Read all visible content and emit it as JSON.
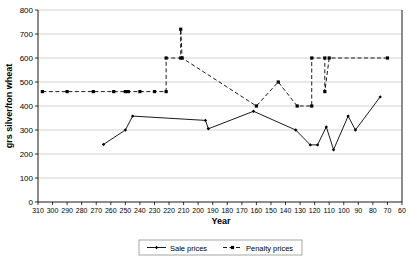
{
  "chart_data": {
    "type": "line",
    "title": "",
    "xlabel": "Year",
    "ylabel": "grs silver/ton wheat",
    "xlim": [
      310,
      60
    ],
    "ylim": [
      0,
      800
    ],
    "x_reversed": true,
    "grid": true,
    "legend_position": "bottom",
    "xticks": [
      310,
      300,
      290,
      280,
      270,
      260,
      250,
      240,
      230,
      220,
      210,
      200,
      190,
      180,
      170,
      160,
      150,
      140,
      130,
      120,
      110,
      100,
      90,
      80,
      70,
      60
    ],
    "yticks": [
      0,
      100,
      200,
      300,
      400,
      500,
      600,
      700,
      800
    ],
    "series": [
      {
        "name": "Sale prices",
        "style": "solid",
        "marker": "diamond",
        "color": "#000000",
        "points": [
          [
            265,
            240
          ],
          [
            250,
            300
          ],
          [
            245,
            358
          ],
          [
            195,
            340
          ],
          [
            193,
            305
          ],
          [
            162,
            378
          ],
          [
            133,
            300
          ],
          [
            123,
            238
          ],
          [
            118,
            238
          ],
          [
            112,
            313
          ],
          [
            107,
            218
          ],
          [
            97,
            358
          ],
          [
            92,
            300
          ],
          [
            75,
            438
          ]
        ]
      },
      {
        "name": "Penalty prices",
        "style": "dashed",
        "marker": "square",
        "color": "#000000",
        "points": [
          [
            307,
            460
          ],
          [
            290,
            460
          ],
          [
            272,
            460
          ],
          [
            258,
            460
          ],
          [
            250,
            460
          ],
          [
            248,
            460
          ],
          [
            240,
            460
          ],
          [
            230,
            460
          ],
          [
            222,
            460
          ],
          [
            222,
            600
          ],
          [
            212,
            600
          ],
          [
            212,
            720
          ],
          [
            211,
            600
          ],
          [
            160,
            400
          ],
          [
            145,
            500
          ],
          [
            132,
            400
          ],
          [
            122,
            400
          ],
          [
            122,
            600
          ],
          [
            113,
            600
          ],
          [
            113,
            460
          ],
          [
            110,
            600
          ],
          [
            70,
            600
          ]
        ]
      }
    ]
  },
  "legend": {
    "entries": [
      {
        "label": "Sale prices",
        "style": "solid",
        "marker": "diamond"
      },
      {
        "label": "Penalty prices",
        "style": "dashed",
        "marker": "square"
      }
    ]
  },
  "axes": {
    "x_title": "Year",
    "y_title": "grs silver/ton wheat",
    "y_tick_0": "0",
    "y_tick_100": "100",
    "y_tick_200": "200",
    "y_tick_300": "300",
    "y_tick_400": "400",
    "y_tick_500": "500",
    "y_tick_600": "600",
    "y_tick_700": "700",
    "y_tick_800": "800"
  }
}
